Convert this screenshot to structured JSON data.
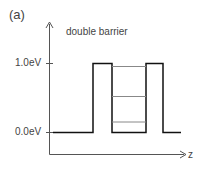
{
  "panel_label": "(a)",
  "title": "double barrier",
  "y_ticks": [
    {
      "label": "1.0eV",
      "value": 1.0
    },
    {
      "label": "0.0eV",
      "value": 0.0
    }
  ],
  "x_axis_label": "z",
  "colors": {
    "potential": "#111111",
    "levels": "#888888",
    "axis": "#555555"
  },
  "diagram": {
    "type": "double barrier potential",
    "barrier_height_eV": 1.0,
    "bound_levels_eV": [
      0.95,
      0.52,
      0.15
    ]
  }
}
